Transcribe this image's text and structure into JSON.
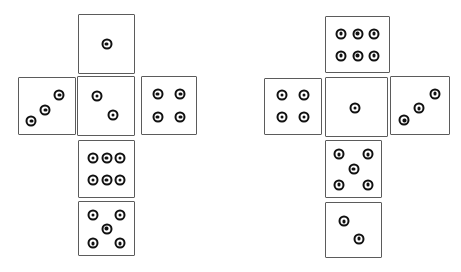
{
  "figure": {
    "background_color": "#ffffff",
    "face_border_color": "#5b5b5b",
    "pip_color": "#111111",
    "pip_style": "bullseye-ring-with-center-dot"
  },
  "nets": [
    {
      "id": "left-net",
      "name": "left-dice-net",
      "faces": [
        {
          "position": "top",
          "name": "face-top",
          "value": 1,
          "x": 78,
          "y": 14,
          "w": 57,
          "h": 60,
          "pips": [
            [
              50,
              50
            ]
          ]
        },
        {
          "position": "middle-left",
          "name": "face-middle-left",
          "value": 3,
          "x": 18,
          "y": 77,
          "w": 58,
          "h": 58,
          "pips": [
            [
              22,
              77
            ],
            [
              47,
              57
            ],
            [
              72,
              30
            ]
          ]
        },
        {
          "position": "middle-center",
          "name": "face-middle-center",
          "value": 2,
          "x": 77,
          "y": 76,
          "w": 58,
          "h": 60,
          "pips": [
            [
              34,
              33
            ],
            [
              62,
              65
            ]
          ]
        },
        {
          "position": "middle-right",
          "name": "face-middle-right",
          "value": 4,
          "x": 141,
          "y": 76,
          "w": 56,
          "h": 59,
          "pips": [
            [
              29,
              30
            ],
            [
              71,
              30
            ],
            [
              29,
              70
            ],
            [
              71,
              70
            ]
          ]
        },
        {
          "position": "bottom-upper",
          "name": "face-bottom-upper",
          "value": 6,
          "x": 78,
          "y": 140,
          "w": 57,
          "h": 58,
          "pips": [
            [
              25,
              30
            ],
            [
              50,
              30
            ],
            [
              75,
              30
            ],
            [
              25,
              70
            ],
            [
              50,
              70
            ],
            [
              75,
              70
            ]
          ]
        },
        {
          "position": "bottom-lower",
          "name": "face-bottom-lower",
          "value": 5,
          "x": 78,
          "y": 201,
          "w": 57,
          "h": 55,
          "pips": [
            [
              25,
              24
            ],
            [
              75,
              24
            ],
            [
              50,
              50
            ],
            [
              25,
              78
            ],
            [
              75,
              78
            ]
          ]
        }
      ]
    },
    {
      "id": "right-net",
      "name": "right-dice-net",
      "faces": [
        {
          "position": "top",
          "name": "face-top",
          "value": 6,
          "x": 325,
          "y": 16,
          "w": 65,
          "h": 57,
          "pips": [
            [
              24,
              30
            ],
            [
              50,
              30
            ],
            [
              76,
              30
            ],
            [
              24,
              70
            ],
            [
              50,
              70
            ],
            [
              76,
              70
            ]
          ]
        },
        {
          "position": "middle-left",
          "name": "face-middle-left",
          "value": 4,
          "x": 264,
          "y": 78,
          "w": 58,
          "h": 57,
          "pips": [
            [
              30,
              29
            ],
            [
              70,
              29
            ],
            [
              30,
              69
            ],
            [
              70,
              69
            ]
          ]
        },
        {
          "position": "middle-center",
          "name": "face-middle-center",
          "value": 1,
          "x": 325,
          "y": 77,
          "w": 63,
          "h": 60,
          "pips": [
            [
              48,
              52
            ]
          ]
        },
        {
          "position": "middle-right",
          "name": "face-middle-right",
          "value": 3,
          "x": 390,
          "y": 76,
          "w": 60,
          "h": 59,
          "pips": [
            [
              23,
              76
            ],
            [
              48,
              55
            ],
            [
              76,
              29
            ]
          ]
        },
        {
          "position": "bottom-upper",
          "name": "face-bottom-upper",
          "value": 5,
          "x": 325,
          "y": 140,
          "w": 57,
          "h": 58,
          "pips": [
            [
              24,
              24
            ],
            [
              76,
              24
            ],
            [
              50,
              50
            ],
            [
              24,
              78
            ],
            [
              76,
              78
            ]
          ]
        },
        {
          "position": "bottom-lower",
          "name": "face-bottom-lower",
          "value": 2,
          "x": 325,
          "y": 202,
          "w": 57,
          "h": 56,
          "pips": [
            [
              33,
              34
            ],
            [
              60,
              66
            ]
          ]
        }
      ]
    }
  ]
}
